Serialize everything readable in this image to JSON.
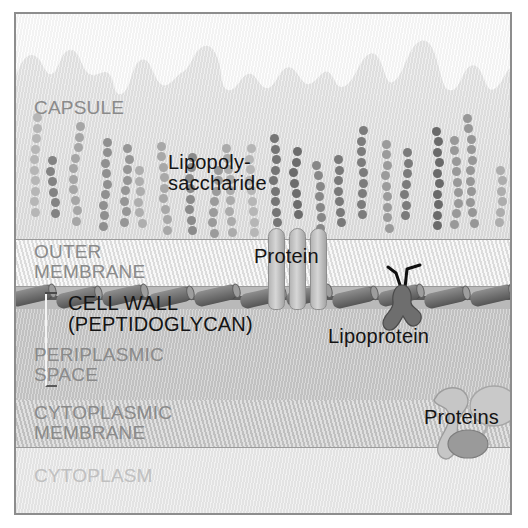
{
  "figure": {
    "border_color": "#8d8d8d"
  },
  "layers": [
    {
      "key": "capsule",
      "label": "CAPSULE",
      "color": "#e2e2e2"
    },
    {
      "key": "outer_membrane",
      "label": "OUTER\nMEMBRANE",
      "color": "#ededed"
    },
    {
      "key": "cell_wall",
      "label": "CELL WALL\n(PEPTIDOGLYCAN)",
      "color": "#b9b9b9"
    },
    {
      "key": "periplasmic_space",
      "label": "PERIPLASMIC\nSPACE",
      "color": "#c4c4c4"
    },
    {
      "key": "cytoplasmic_membrane",
      "label": "CYTOPLASMIC\nMEMBRANE",
      "color": "#cbcbcb"
    },
    {
      "key": "cytoplasm",
      "label": "CYTOPLASM",
      "color": "#ebebeb"
    }
  ],
  "labels": {
    "capsule": "CAPSULE",
    "outer_membrane": "OUTER\nMEMBRANE",
    "cell_wall": "CELL WALL\n(PEPTIDOGLYCAN)",
    "periplasmic_space": "PERIPLASMIC\nSPACE",
    "cytoplasmic_membrane": "CYTOPLASMIC\nMEMBRANE",
    "cytoplasm": "CYTOPLASM",
    "lipopolysaccharide": "Lipopoly-\nsaccharide",
    "protein": "Protein",
    "lipoprotein": "Lipoprotein",
    "proteins": "Proteins"
  },
  "label_styles": {
    "structure_text_color": "#8a8a8a",
    "cytoplasm_text_color": "#c0c0c0",
    "callout_text_color": "#141414"
  },
  "structures": {
    "lipopolysaccharide": {
      "name": "lipopolysaccharide-chains",
      "count": 22,
      "bead_color": "#8f8f8f",
      "description": "beaded sugar chains projecting up from the outer membrane into the capsule"
    },
    "peptidoglycan": {
      "name": "peptidoglycan-units",
      "count": 11,
      "unit_color": "#6f6f6f",
      "strand_color": "#5b5b5b"
    },
    "porin_protein": {
      "name": "porin-protein",
      "subunits": 3,
      "color": "#c0c0c0",
      "spans": "outer_membrane"
    },
    "lipoprotein": {
      "name": "lipoprotein",
      "color": "#6e6e6e",
      "tail_color": "#101010",
      "anchors_to": "peptidoglycan"
    },
    "membrane_proteins": {
      "name": "cytoplasmic-membrane-proteins",
      "count": 3,
      "colors": [
        "#bdbdbd",
        "#c9c9c9",
        "#9a9a9a"
      ]
    }
  }
}
